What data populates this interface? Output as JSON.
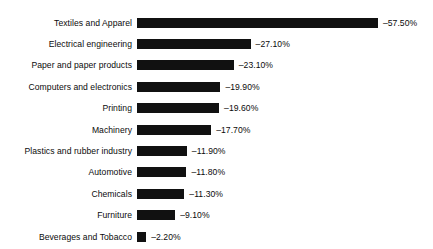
{
  "chart_data": {
    "type": "bar",
    "orientation": "horizontal",
    "title": "",
    "subtitle": "",
    "xlabel": "",
    "ylabel": "",
    "grid": false,
    "legend": false,
    "axis_visible": false,
    "value_suffix": "%",
    "xlim": [
      -57.5,
      0
    ],
    "categories": [
      "Textiles and Apparel",
      "Electrical engineering",
      "Paper and paper products",
      "Computers and electronics",
      "Printing",
      "Machinery",
      "Plastics and rubber industry",
      "Automotive",
      "Chemicals",
      "Furniture",
      "Beverages and Tobacco"
    ],
    "values": [
      -57.5,
      -27.1,
      -23.1,
      -19.9,
      -19.6,
      -17.7,
      -11.9,
      -11.8,
      -11.3,
      -9.1,
      -2.2
    ],
    "value_labels": [
      "–57.50%",
      "–27.10%",
      "–23.10%",
      "–19.90%",
      "–19.60%",
      "–17.70%",
      "–11.90%",
      "–11.80%",
      "–11.30%",
      "–9.10%",
      "–2.20%"
    ],
    "bar_color": "#111111",
    "background_color": "#ffffff",
    "text_color": "#0b0b0b",
    "px_per_unit": 4.19
  }
}
